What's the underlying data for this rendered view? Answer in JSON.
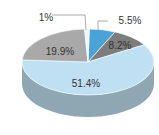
{
  "chart_data": {
    "type": "pie",
    "style": "3d",
    "title": "",
    "slices": [
      {
        "label": "5.5%",
        "value": 5.5,
        "color": "#4aa3d6"
      },
      {
        "label": "8.2%",
        "value": 8.2,
        "color": "#7d7d7d"
      },
      {
        "label": "51.4%",
        "value": 51.4,
        "color": "#bfe0f2"
      },
      {
        "label": "19.9%",
        "value": 19.9,
        "color": "#a9a9a9"
      },
      {
        "label": "1%",
        "value": 1,
        "color": "#eef6fb"
      }
    ],
    "side_color": "#8fa6b3",
    "legend": "none"
  }
}
